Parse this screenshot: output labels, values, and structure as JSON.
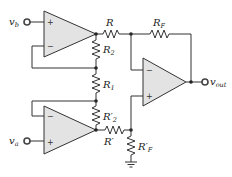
{
  "diagram": {
    "type": "instrumentation-amplifier-circuit",
    "inputs": [
      {
        "id": "vb",
        "label": "v",
        "subscript": "b"
      },
      {
        "id": "va",
        "label": "v",
        "subscript": "a"
      }
    ],
    "output": {
      "id": "vout",
      "label": "v",
      "subscript": "out"
    },
    "resistors": [
      {
        "id": "R",
        "label": "R",
        "subscript": ""
      },
      {
        "id": "RF",
        "label": "R",
        "subscript": "F"
      },
      {
        "id": "R2",
        "label": "R",
        "subscript": "2"
      },
      {
        "id": "R1",
        "label": "R",
        "subscript": "1"
      },
      {
        "id": "R2p",
        "label": "R′",
        "subscript": "2"
      },
      {
        "id": "Rp",
        "label": "R′",
        "subscript": ""
      },
      {
        "id": "RFp",
        "label": "R′",
        "subscript": "F"
      }
    ],
    "opamps": [
      {
        "id": "top",
        "plus": "+",
        "minus": "−"
      },
      {
        "id": "bottom",
        "plus": "+",
        "minus": "−"
      },
      {
        "id": "right",
        "plus": "+",
        "minus": "−"
      }
    ],
    "ground": "ground"
  }
}
